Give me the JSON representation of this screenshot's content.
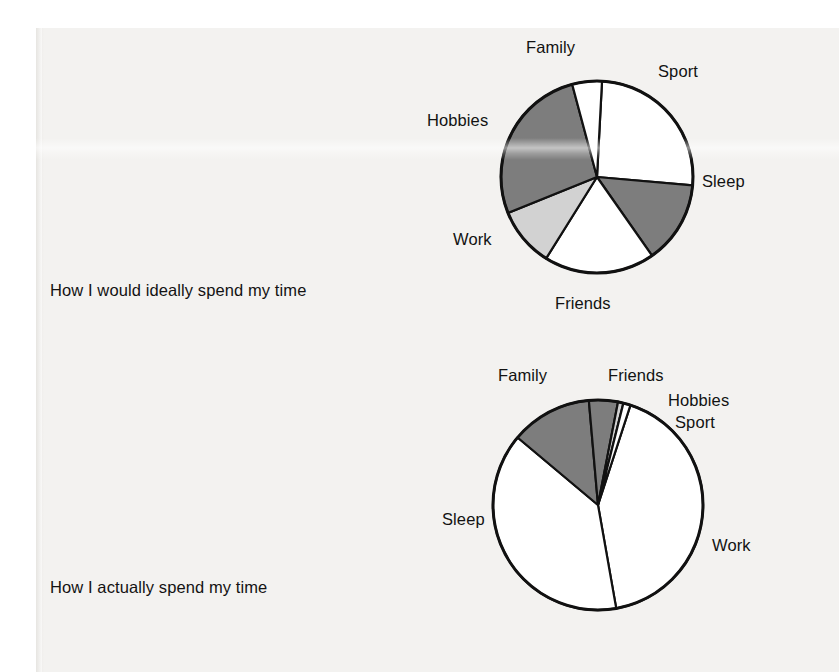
{
  "page": {
    "background_color": "#f3f2f0",
    "ink_color": "#121212"
  },
  "captions": {
    "ideal": "How I would ideally spend my time",
    "actual": "How I actually spend my time"
  },
  "palette": {
    "dark_gray": "#7d7d7d",
    "light_gray": "#d2d2d2",
    "white": "#ffffff",
    "outline": "#111111"
  },
  "chart_data": [
    {
      "type": "pie",
      "title": "How I would ideally spend my time",
      "id": "ideal",
      "legend": "labels-around-slices",
      "center": [
        157,
        147
      ],
      "radius": 96,
      "start_angle_deg": 3,
      "categories": [
        "Sleep",
        "Friends",
        "Work",
        "Hobbies",
        "Family",
        "Sport"
      ],
      "values": [
        25.6,
        13.9,
        18.6,
        10.0,
        27.0,
        4.9
      ],
      "slices": [
        {
          "label": "Sleep",
          "value": 25.6,
          "fill": "#ffffff",
          "start_deg": 3,
          "end_deg": 95
        },
        {
          "label": "Friends",
          "value": 13.9,
          "fill": "#7d7d7d",
          "start_deg": 95,
          "end_deg": 145
        },
        {
          "label": "Work",
          "value": 18.6,
          "fill": "#ffffff",
          "start_deg": 145,
          "end_deg": 212
        },
        {
          "label": "Hobbies",
          "value": 10.0,
          "fill": "#d2d2d2",
          "start_deg": 212,
          "end_deg": 248
        },
        {
          "label": "Family",
          "value": 27.0,
          "fill": "#7d7d7d",
          "start_deg": 248,
          "end_deg": 345
        },
        {
          "label": "Sport",
          "value": 4.9,
          "fill": "#ffffff",
          "start_deg": 345,
          "end_deg": 363
        }
      ],
      "labels": [
        {
          "text": "Family",
          "x": 86,
          "y": 8
        },
        {
          "text": "Sport",
          "x": 218,
          "y": 32
        },
        {
          "text": "Sleep",
          "x": 262,
          "y": 142
        },
        {
          "text": "Friends",
          "x": 115,
          "y": 264
        },
        {
          "text": "Work",
          "x": 13,
          "y": 200
        },
        {
          "text": "Hobbies",
          "x": -13,
          "y": 81
        }
      ]
    },
    {
      "type": "pie",
      "title": "How I actually spend my time",
      "id": "actual",
      "legend": "labels-around-slices",
      "center": [
        158,
        147
      ],
      "radius": 105,
      "start_angle_deg": 18,
      "categories": [
        "Work",
        "Sleep",
        "Family",
        "Friends",
        "Hobbies",
        "Sport"
      ],
      "values": [
        42.2,
        38.9,
        12.5,
        4.4,
        0.8,
        1.1
      ],
      "slices": [
        {
          "label": "Work",
          "value": 42.2,
          "fill": "#ffffff",
          "start_deg": 18,
          "end_deg": 170
        },
        {
          "label": "Sleep",
          "value": 38.9,
          "fill": "#ffffff",
          "start_deg": 170,
          "end_deg": 310
        },
        {
          "label": "Family",
          "value": 12.5,
          "fill": "#7d7d7d",
          "start_deg": 310,
          "end_deg": 355
        },
        {
          "label": "Friends",
          "value": 4.4,
          "fill": "#7d7d7d",
          "start_deg": 355,
          "end_deg": 371
        },
        {
          "label": "Hobbies",
          "value": 0.8,
          "fill": "#d2d2d2",
          "start_deg": 371,
          "end_deg": 374
        },
        {
          "label": "Sport",
          "value": 1.1,
          "fill": "#ffffff",
          "start_deg": 374,
          "end_deg": 378
        }
      ],
      "labels": [
        {
          "text": "Family",
          "x": 58,
          "y": 8
        },
        {
          "text": "Friends",
          "x": 168,
          "y": 8
        },
        {
          "text": "Hobbies",
          "x": 228,
          "y": 33
        },
        {
          "text": "Sport",
          "x": 235,
          "y": 55
        },
        {
          "text": "Work",
          "x": 272,
          "y": 178
        },
        {
          "text": "Sleep",
          "x": 2,
          "y": 152
        }
      ]
    }
  ]
}
